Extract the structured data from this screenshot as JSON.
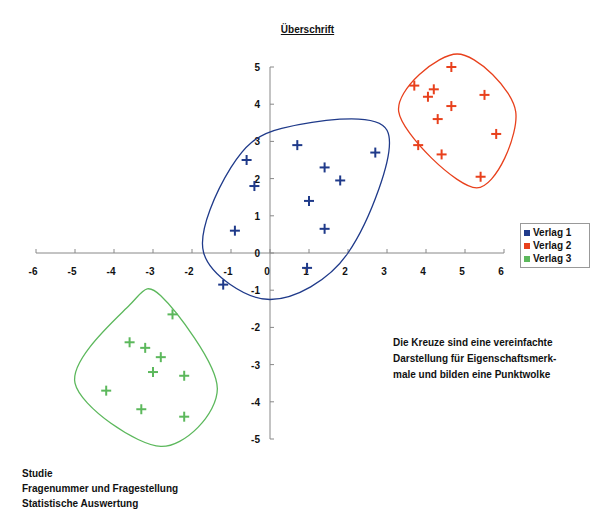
{
  "chart_data": {
    "type": "scatter",
    "title": "Überschrift",
    "xlabel": "",
    "ylabel": "",
    "xlim": [
      -6,
      6
    ],
    "ylim": [
      -5,
      5
    ],
    "x_ticks": [
      -6,
      -5,
      -4,
      -3,
      -2,
      -1,
      0,
      1,
      2,
      3,
      4,
      5,
      6
    ],
    "y_ticks": [
      -5,
      -4,
      -3,
      -2,
      -1,
      0,
      1,
      2,
      3,
      4,
      5
    ],
    "grid": false,
    "legend_position": "right",
    "marker": "+",
    "series": [
      {
        "name": "Verlag 1",
        "color": "#1f3a8a",
        "points": [
          {
            "x": -0.6,
            "y": 2.5
          },
          {
            "x": -0.4,
            "y": 1.8
          },
          {
            "x": 0.7,
            "y": 2.9
          },
          {
            "x": 1.4,
            "y": 2.3
          },
          {
            "x": 1.8,
            "y": 1.95
          },
          {
            "x": 2.7,
            "y": 2.7
          },
          {
            "x": 1.0,
            "y": 1.4
          },
          {
            "x": -0.9,
            "y": 0.6
          },
          {
            "x": 1.4,
            "y": 0.65
          },
          {
            "x": 0.95,
            "y": -0.4
          },
          {
            "x": -1.2,
            "y": -0.85
          }
        ]
      },
      {
        "name": "Verlag 2",
        "color": "#e8401c",
        "points": [
          {
            "x": 4.65,
            "y": 5.0
          },
          {
            "x": 3.7,
            "y": 4.5
          },
          {
            "x": 4.2,
            "y": 4.4
          },
          {
            "x": 4.05,
            "y": 4.2
          },
          {
            "x": 4.65,
            "y": 3.95
          },
          {
            "x": 5.5,
            "y": 4.25
          },
          {
            "x": 4.3,
            "y": 3.6
          },
          {
            "x": 5.8,
            "y": 3.2
          },
          {
            "x": 3.8,
            "y": 2.9
          },
          {
            "x": 4.4,
            "y": 2.65
          },
          {
            "x": 5.4,
            "y": 2.05
          }
        ]
      },
      {
        "name": "Verlag 3",
        "color": "#5cb85c",
        "points": [
          {
            "x": -2.5,
            "y": -1.65
          },
          {
            "x": -3.6,
            "y": -2.4
          },
          {
            "x": -3.2,
            "y": -2.55
          },
          {
            "x": -2.8,
            "y": -2.8
          },
          {
            "x": -3.0,
            "y": -3.2
          },
          {
            "x": -2.2,
            "y": -3.3
          },
          {
            "x": -4.2,
            "y": -3.7
          },
          {
            "x": -3.3,
            "y": -4.2
          },
          {
            "x": -2.2,
            "y": -4.4
          }
        ]
      }
    ],
    "clusters": [
      {
        "series": "Verlag 1",
        "outline": [
          [
            0.3,
            3.35
          ],
          [
            3.0,
            3.3
          ],
          [
            2.0,
            0.0
          ],
          [
            0.0,
            -1.25
          ],
          [
            -1.7,
            0.0
          ],
          [
            -1.0,
            2.3
          ]
        ]
      },
      {
        "series": "Verlag 2",
        "outline": [
          [
            4.8,
            5.35
          ],
          [
            6.3,
            3.8
          ],
          [
            5.3,
            1.75
          ],
          [
            3.3,
            3.8
          ]
        ]
      },
      {
        "series": "Verlag 3",
        "outline": [
          [
            -2.8,
            -1.15
          ],
          [
            -1.35,
            -3.65
          ],
          [
            -2.8,
            -5.2
          ],
          [
            -5.0,
            -3.5
          ],
          [
            -3.6,
            -1.4
          ]
        ]
      }
    ],
    "annotation": "Die Kreuze sind eine vereinfachte Darstellung für Eigenschaftsmerk-male und bilden eine Punktwolke"
  },
  "legend": {
    "items": [
      {
        "label": "Verlag 1",
        "color": "#1f3a8a"
      },
      {
        "label": "Verlag 2",
        "color": "#e8401c"
      },
      {
        "label": "Verlag 3",
        "color": "#5cb85c"
      }
    ]
  },
  "note": {
    "lines": [
      "Die Kreuze sind eine vereinfachte",
      "Darstellung für Eigenschaftsmerk-",
      "male und bilden eine Punktwolke"
    ]
  },
  "footer": {
    "lines": [
      "Studie",
      "Fragenummer und Fragestellung",
      "Statistische Auswertung"
    ]
  }
}
